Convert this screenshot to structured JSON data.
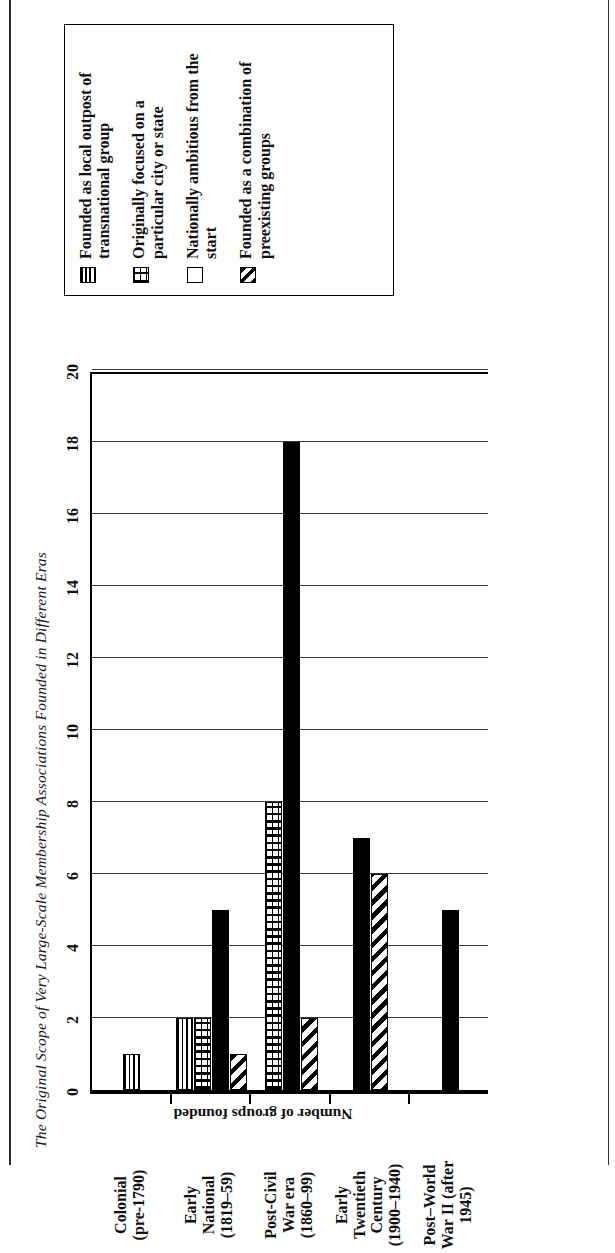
{
  "figure": {
    "title": "The Original Scope of Very Large-Scale Membership Associations Founded in Different Eras"
  },
  "legend": {
    "items": [
      {
        "label": "Founded as local outpost of transnational group",
        "pattern": "horizontal-lines",
        "swatch_name": "legend-swatch-horizontal-lines"
      },
      {
        "label": "Originally focused on a particular city or state",
        "pattern": "brick",
        "swatch_name": "legend-swatch-brick"
      },
      {
        "label": "Nationally ambitious from the start",
        "pattern": "solid",
        "swatch_name": "legend-swatch-solid-black"
      },
      {
        "label": "Founded as a combination of preexisting groups",
        "pattern": "diagonal",
        "swatch_name": "legend-swatch-diagonal-hatch"
      }
    ]
  },
  "chart_data": {
    "type": "bar",
    "title": "The Original Scope of Very Large-Scale Membership Associations Founded in Different Eras",
    "orientation": "vertical",
    "xlabel": "",
    "ylabel": "Number of groups founded",
    "ylim": [
      0,
      20
    ],
    "yticks": [
      0,
      2,
      4,
      6,
      8,
      10,
      12,
      14,
      16,
      18,
      20
    ],
    "ytick_labels": [
      "0",
      "2",
      "4",
      "6",
      "8",
      "10",
      "12",
      "14",
      "16",
      "18",
      "20"
    ],
    "grid": true,
    "legend_position": "right",
    "categories": [
      "Colonial (pre-1790)",
      "Early National (1819–59)",
      "Post-Civil War era (1860–99)",
      "Early Twentieth Century (1900–1940)",
      "Post–World War II (after 1945)"
    ],
    "category_lines": [
      [
        "Colonial",
        "(pre-1790)"
      ],
      [
        "Early",
        "National",
        "(1819–59)"
      ],
      [
        "Post-Civil",
        "War era",
        "(1860–99)"
      ],
      [
        "Early",
        "Twentieth",
        "Century",
        "(1900–1940)"
      ],
      [
        "Post–World",
        "War II (after",
        "1945)"
      ]
    ],
    "series": [
      {
        "name": "Founded as local outpost of transnational group",
        "pattern": "horizontal-lines",
        "values": [
          1,
          2,
          0,
          0,
          0
        ]
      },
      {
        "name": "Originally focused on a particular city or state",
        "pattern": "brick",
        "values": [
          0,
          2,
          8,
          0,
          0
        ]
      },
      {
        "name": "Nationally ambitious from the start",
        "pattern": "solid",
        "values": [
          0,
          5,
          18,
          7,
          5
        ]
      },
      {
        "name": "Founded as a combination of preexisting groups",
        "pattern": "diagonal",
        "values": [
          0,
          1,
          2,
          6,
          0
        ]
      }
    ]
  }
}
